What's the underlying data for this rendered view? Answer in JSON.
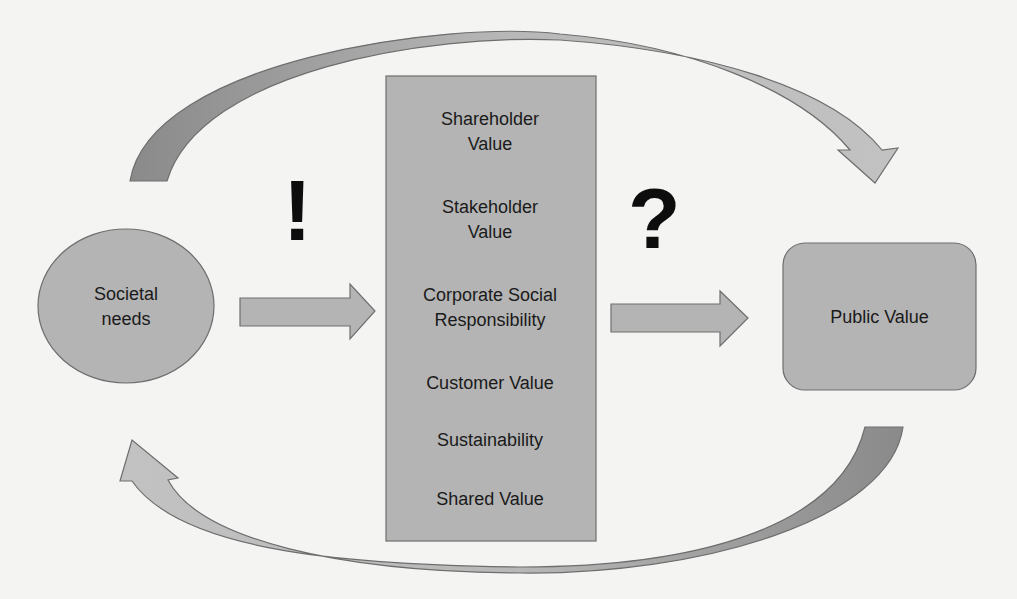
{
  "diagram": {
    "left_node": {
      "label_line1": "Societal",
      "label_line2": "needs"
    },
    "right_node": {
      "label": "Public Value"
    },
    "center_box": {
      "items": [
        {
          "line1": "Shareholder",
          "line2": "Value"
        },
        {
          "line1": "Stakeholder",
          "line2": "Value"
        },
        {
          "line1": "Corporate Social",
          "line2": "Responsibility"
        },
        {
          "line1": "Customer Value",
          "line2": ""
        },
        {
          "line1": "Sustainability",
          "line2": ""
        },
        {
          "line1": "Shared Value",
          "line2": ""
        }
      ]
    },
    "left_mark": "!",
    "right_mark": "?",
    "colors": {
      "shape_fill": "#b4b4b4",
      "shape_stroke": "#6e6e6e",
      "background": "#f4f4f3",
      "text": "#1a1a1a"
    }
  }
}
